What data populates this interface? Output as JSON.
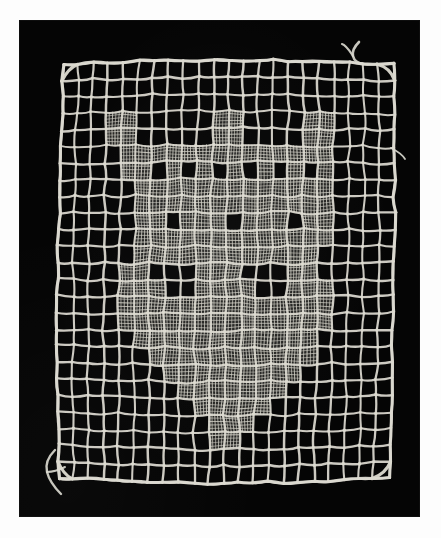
{
  "page": {
    "background_color": "#fdfdfd",
    "width": 441,
    "height": 538
  },
  "photo": {
    "label": "filet-lace-square-photograph",
    "background_color": "#050505",
    "x": 19,
    "y": 20,
    "width": 401,
    "height": 497,
    "subject": "Square of darned net lace (filet / lacis) with figural motif",
    "thread_color": "#dcdad0",
    "thread_shadow_color": "#8c8a82",
    "darned_fill_color": "#cfcdc3"
  },
  "lace": {
    "name": "net-lace-square",
    "mesh_columns": 22,
    "mesh_rows": 25,
    "cell_size_px": 15.6,
    "corner_round_px": 26,
    "loose_thread_tails": [
      {
        "name": "thread-tail-top-right",
        "x": 355,
        "y": 36
      },
      {
        "name": "thread-tail-bottom-left",
        "x": 47,
        "y": 452
      },
      {
        "name": "thread-tail-right-edge",
        "x": 385,
        "y": 150
      }
    ],
    "darned_pattern_description": "Central figural motif worked in close darning (point de toile) on the net ground; surrounded by five to six rows of plain open mesh as a border.",
    "darned_cells": [
      [
        3,
        3
      ],
      [
        3,
        4
      ],
      [
        3,
        10
      ],
      [
        3,
        11
      ],
      [
        3,
        16
      ],
      [
        3,
        17
      ],
      [
        4,
        3
      ],
      [
        4,
        4
      ],
      [
        4,
        10
      ],
      [
        4,
        11
      ],
      [
        4,
        16
      ],
      [
        4,
        17
      ],
      [
        5,
        4
      ],
      [
        5,
        5
      ],
      [
        5,
        6
      ],
      [
        5,
        7
      ],
      [
        5,
        8
      ],
      [
        5,
        9
      ],
      [
        5,
        10
      ],
      [
        5,
        11
      ],
      [
        5,
        12
      ],
      [
        5,
        13
      ],
      [
        5,
        14
      ],
      [
        5,
        15
      ],
      [
        5,
        16
      ],
      [
        5,
        17
      ],
      [
        6,
        4
      ],
      [
        6,
        5
      ],
      [
        6,
        7
      ],
      [
        6,
        9
      ],
      [
        6,
        11
      ],
      [
        6,
        13
      ],
      [
        6,
        15
      ],
      [
        6,
        17
      ],
      [
        7,
        5
      ],
      [
        7,
        6
      ],
      [
        7,
        7
      ],
      [
        7,
        8
      ],
      [
        7,
        9
      ],
      [
        7,
        10
      ],
      [
        7,
        11
      ],
      [
        7,
        12
      ],
      [
        7,
        13
      ],
      [
        7,
        14
      ],
      [
        7,
        15
      ],
      [
        7,
        16
      ],
      [
        7,
        17
      ],
      [
        8,
        5
      ],
      [
        8,
        6
      ],
      [
        8,
        7
      ],
      [
        8,
        8
      ],
      [
        8,
        9
      ],
      [
        8,
        10
      ],
      [
        8,
        11
      ],
      [
        8,
        12
      ],
      [
        8,
        13
      ],
      [
        8,
        14
      ],
      [
        8,
        15
      ],
      [
        8,
        16
      ],
      [
        8,
        17
      ],
      [
        9,
        5
      ],
      [
        9,
        6
      ],
      [
        9,
        8
      ],
      [
        9,
        9
      ],
      [
        9,
        10
      ],
      [
        9,
        12
      ],
      [
        9,
        13
      ],
      [
        9,
        14
      ],
      [
        9,
        16
      ],
      [
        9,
        17
      ],
      [
        10,
        5
      ],
      [
        10,
        6
      ],
      [
        10,
        7
      ],
      [
        10,
        8
      ],
      [
        10,
        9
      ],
      [
        10,
        10
      ],
      [
        10,
        11
      ],
      [
        10,
        12
      ],
      [
        10,
        13
      ],
      [
        10,
        14
      ],
      [
        10,
        15
      ],
      [
        10,
        16
      ],
      [
        10,
        17
      ],
      [
        11,
        5
      ],
      [
        11,
        6
      ],
      [
        11,
        7
      ],
      [
        11,
        8
      ],
      [
        11,
        9
      ],
      [
        11,
        10
      ],
      [
        11,
        11
      ],
      [
        11,
        12
      ],
      [
        11,
        13
      ],
      [
        11,
        14
      ],
      [
        11,
        15
      ],
      [
        11,
        16
      ],
      [
        12,
        4
      ],
      [
        12,
        5
      ],
      [
        12,
        9
      ],
      [
        12,
        10
      ],
      [
        12,
        11
      ],
      [
        12,
        15
      ],
      [
        12,
        16
      ],
      [
        13,
        4
      ],
      [
        13,
        5
      ],
      [
        13,
        6
      ],
      [
        13,
        9
      ],
      [
        13,
        10
      ],
      [
        13,
        11
      ],
      [
        13,
        12
      ],
      [
        13,
        15
      ],
      [
        13,
        16
      ],
      [
        13,
        17
      ],
      [
        14,
        4
      ],
      [
        14,
        5
      ],
      [
        14,
        6
      ],
      [
        14,
        7
      ],
      [
        14,
        8
      ],
      [
        14,
        9
      ],
      [
        14,
        10
      ],
      [
        14,
        11
      ],
      [
        14,
        12
      ],
      [
        14,
        13
      ],
      [
        14,
        14
      ],
      [
        14,
        15
      ],
      [
        14,
        16
      ],
      [
        14,
        17
      ],
      [
        15,
        4
      ],
      [
        15,
        5
      ],
      [
        15,
        6
      ],
      [
        15,
        7
      ],
      [
        15,
        8
      ],
      [
        15,
        9
      ],
      [
        15,
        10
      ],
      [
        15,
        11
      ],
      [
        15,
        12
      ],
      [
        15,
        13
      ],
      [
        15,
        14
      ],
      [
        15,
        15
      ],
      [
        15,
        16
      ],
      [
        15,
        17
      ],
      [
        16,
        5
      ],
      [
        16,
        6
      ],
      [
        16,
        7
      ],
      [
        16,
        8
      ],
      [
        16,
        9
      ],
      [
        16,
        10
      ],
      [
        16,
        11
      ],
      [
        16,
        12
      ],
      [
        16,
        13
      ],
      [
        16,
        14
      ],
      [
        16,
        15
      ],
      [
        16,
        16
      ],
      [
        17,
        6
      ],
      [
        17,
        7
      ],
      [
        17,
        8
      ],
      [
        17,
        9
      ],
      [
        17,
        10
      ],
      [
        17,
        11
      ],
      [
        17,
        12
      ],
      [
        17,
        13
      ],
      [
        17,
        14
      ],
      [
        17,
        15
      ],
      [
        17,
        16
      ],
      [
        18,
        7
      ],
      [
        18,
        8
      ],
      [
        18,
        9
      ],
      [
        18,
        10
      ],
      [
        18,
        11
      ],
      [
        18,
        12
      ],
      [
        18,
        13
      ],
      [
        18,
        14
      ],
      [
        18,
        15
      ],
      [
        19,
        8
      ],
      [
        19,
        9
      ],
      [
        19,
        10
      ],
      [
        19,
        11
      ],
      [
        19,
        12
      ],
      [
        19,
        13
      ],
      [
        19,
        14
      ],
      [
        20,
        9
      ],
      [
        20,
        10
      ],
      [
        20,
        11
      ],
      [
        20,
        12
      ],
      [
        20,
        13
      ],
      [
        21,
        10
      ],
      [
        21,
        11
      ],
      [
        21,
        12
      ],
      [
        22,
        10
      ],
      [
        22,
        11
      ]
    ]
  }
}
